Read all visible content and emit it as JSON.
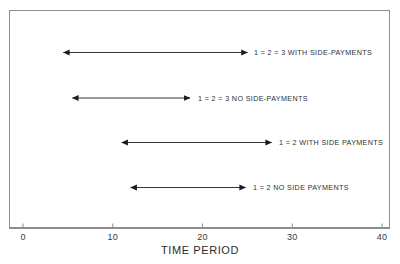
{
  "chart_data": {
    "type": "bar",
    "orientation": "horizontal-range",
    "title": "",
    "xlabel": "TIME PERIOD",
    "ylabel": "",
    "xlim": [
      0,
      42.5
    ],
    "xticks": [
      0,
      10,
      20,
      30,
      40
    ],
    "xtick_labels": [
      "0",
      "10",
      "20",
      "30",
      "40"
    ],
    "grid": false,
    "legend": "none",
    "categories": [
      "1 = 2 = 3 WITH SIDE-PAYMENTS",
      "1 = 2 = 3 NO SIDE-PAYMENTS",
      "1 = 2 WITH SIDE PAYMENTS",
      "1 = 2 NO SIDE PAYMENTS"
    ],
    "series": [
      {
        "name": "interval start",
        "values": [
          4.5,
          5.5,
          11.0,
          12.0
        ]
      },
      {
        "name": "interval end",
        "values": [
          25.0,
          18.6,
          27.7,
          24.8
        ]
      }
    ],
    "ranges": [
      {
        "label": "1 = 2 = 3 WITH SIDE-PAYMENTS",
        "start": 4.5,
        "end": 25.0
      },
      {
        "label": "1 = 2 = 3 NO SIDE-PAYMENTS",
        "start": 5.5,
        "end": 18.6
      },
      {
        "label": "1 = 2 WITH SIDE PAYMENTS",
        "start": 11.0,
        "end": 27.7
      },
      {
        "label": "1 = 2 NO SIDE PAYMENTS",
        "start": 12.0,
        "end": 24.8
      }
    ],
    "line_color": "#1c1c1c",
    "frame_color": "#8d8d8d",
    "background": "#ffffff"
  },
  "axis": {
    "title": "TIME PERIOD",
    "ticks": [
      {
        "label": "0"
      },
      {
        "label": "10"
      },
      {
        "label": "20"
      },
      {
        "label": "30"
      },
      {
        "label": "40"
      }
    ]
  },
  "rows": [
    {
      "label": "1 = 2 = 3 WITH SIDE-PAYMENTS"
    },
    {
      "label": "1 = 2 = 3 NO SIDE-PAYMENTS"
    },
    {
      "label": "1 = 2 WITH SIDE PAYMENTS"
    },
    {
      "label": "1 = 2 NO SIDE PAYMENTS"
    }
  ]
}
